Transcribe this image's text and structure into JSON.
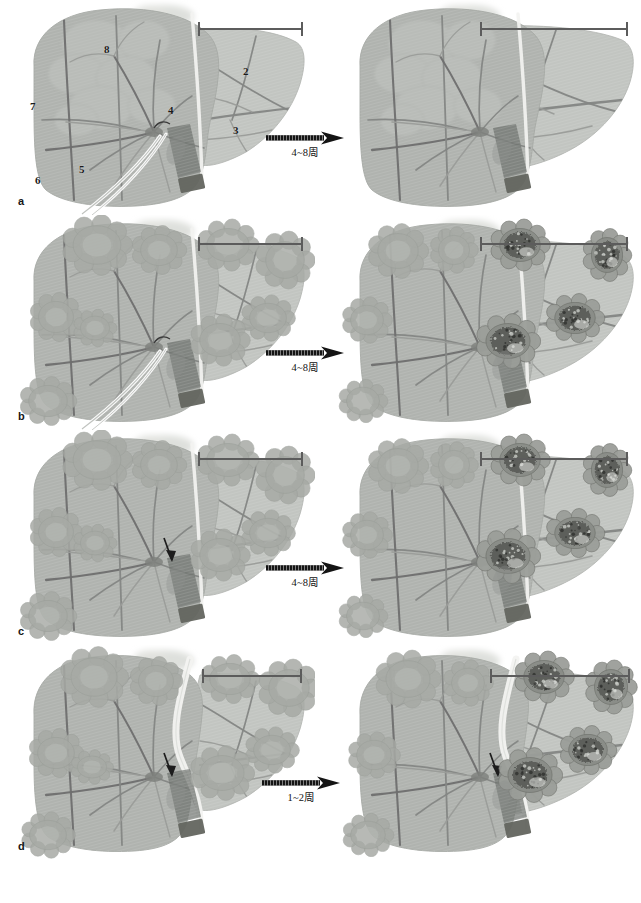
{
  "figure": {
    "width": 641,
    "height": 903,
    "background": "#ffffff"
  },
  "colors": {
    "liver_fill": "#b9bcb8",
    "liver_fill_light": "#c6c9c5",
    "liver_left_lobe": "#b0b3af",
    "liver_right_lobe": "#c2c5c1",
    "vessel_dark": "#6f6f6f",
    "vessel_mid": "#848684",
    "vessel_light": "#9a9c99",
    "gallbladder": "#8d8f8c",
    "clamp": "#6e716d",
    "tumor_light": "#a7aaa5",
    "tumor_dark": "#5a5c58",
    "bracket": "#5c5c5c",
    "arrow": "#141414",
    "text": "#161616",
    "ligament_white": "#f3f3f1"
  },
  "segments": {
    "caption": "Couinaud liver segment numbers shown on panel a (left image)",
    "labels": [
      {
        "id": "seg-8",
        "text": "8",
        "x": 104,
        "y": 44
      },
      {
        "id": "seg-2",
        "text": "2",
        "x": 243,
        "y": 66
      },
      {
        "id": "seg-4",
        "text": "4",
        "x": 168,
        "y": 105
      },
      {
        "id": "seg-3",
        "text": "3",
        "x": 233,
        "y": 125
      },
      {
        "id": "seg-7",
        "text": "7",
        "x": 30,
        "y": 101
      },
      {
        "id": "seg-5",
        "text": "5",
        "x": 79,
        "y": 164
      },
      {
        "id": "seg-6",
        "text": "6",
        "x": 35,
        "y": 175
      }
    ]
  },
  "rows": [
    {
      "id": "row-a",
      "letter": "a",
      "top": 0,
      "arrow": {
        "label": "4~8周",
        "x": 266,
        "y": 131
      },
      "left": {
        "id": "panel-a-before",
        "name": "liver-before-a",
        "description": "Normal liver with portal clamp and catheter, segment numbers labelled",
        "tumors": [],
        "tumor_style": "none",
        "has_catheter": true,
        "has_clamp": true,
        "shape": "normal",
        "bracket": {
          "x": 194,
          "y": 22,
          "width": 105
        }
      },
      "right": {
        "id": "panel-a-after",
        "name": "liver-after-a",
        "description": "Hypertrophied right lobe after 4-8 weeks",
        "tumors": [],
        "tumor_style": "none",
        "has_catheter": false,
        "has_clamp": true,
        "shape": "hypertrophy",
        "bracket": {
          "x": 150,
          "y": 22,
          "width": 148
        }
      }
    },
    {
      "id": "row-b",
      "letter": "b",
      "top": 215,
      "arrow": {
        "label": "4~8周",
        "x": 266,
        "y": 346
      },
      "left": {
        "id": "panel-b-before",
        "name": "liver-before-b",
        "description": "Liver with multiple pale metastatic nodules and indwelling catheter",
        "tumors": [
          {
            "x": 93,
            "y": 30,
            "rx": 26,
            "ry": 21,
            "tone": "light"
          },
          {
            "x": 155,
            "y": 35,
            "rx": 20,
            "ry": 17,
            "tone": "light"
          },
          {
            "x": 52,
            "y": 102,
            "rx": 19,
            "ry": 17,
            "tone": "light"
          },
          {
            "x": 91,
            "y": 113,
            "rx": 16,
            "ry": 13,
            "tone": "light"
          },
          {
            "x": 44,
            "y": 186,
            "rx": 21,
            "ry": 17,
            "tone": "light"
          },
          {
            "x": 224,
            "y": 30,
            "rx": 23,
            "ry": 18,
            "tone": "light"
          },
          {
            "x": 281,
            "y": 45,
            "rx": 21,
            "ry": 20,
            "tone": "light"
          },
          {
            "x": 264,
            "y": 103,
            "rx": 20,
            "ry": 16,
            "tone": "light"
          },
          {
            "x": 216,
            "y": 125,
            "rx": 22,
            "ry": 18,
            "tone": "light"
          }
        ],
        "tumor_style": "light",
        "has_catheter": true,
        "has_clamp": true,
        "shape": "normal",
        "bracket": {
          "x": 194,
          "y": 22,
          "width": 105
        }
      },
      "right": {
        "id": "panel-b-after",
        "name": "liver-after-b",
        "description": "After 4-8 weeks: right lobe hypertrophy with enlarged dark necrotic tumours",
        "tumors": [
          {
            "x": 68,
            "y": 36,
            "rx": 22,
            "ry": 19,
            "tone": "light"
          },
          {
            "x": 124,
            "y": 35,
            "rx": 17,
            "ry": 16,
            "tone": "light"
          },
          {
            "x": 37,
            "y": 105,
            "rx": 18,
            "ry": 16,
            "tone": "light"
          },
          {
            "x": 33,
            "y": 186,
            "rx": 18,
            "ry": 15,
            "tone": "light"
          },
          {
            "x": 190,
            "y": 30,
            "rx": 22,
            "ry": 18,
            "tone": "dark"
          },
          {
            "x": 277,
            "y": 40,
            "rx": 17,
            "ry": 19,
            "tone": "dark"
          },
          {
            "x": 245,
            "y": 103,
            "rx": 22,
            "ry": 17,
            "tone": "dark"
          },
          {
            "x": 178,
            "y": 126,
            "rx": 24,
            "ry": 19,
            "tone": "dark"
          }
        ],
        "tumor_style": "dark",
        "has_catheter": false,
        "has_clamp": true,
        "shape": "hypertrophy",
        "bracket": {
          "x": 150,
          "y": 22,
          "width": 148
        }
      }
    },
    {
      "id": "row-c",
      "letter": "c",
      "top": 430,
      "arrow": {
        "label": "4~8周",
        "x": 266,
        "y": 561
      },
      "left": {
        "id": "panel-c-before",
        "name": "liver-before-c",
        "description": "Liver with pale nodules, portal vein ligated (arrowhead), no catheter",
        "tumors": [
          {
            "x": 93,
            "y": 30,
            "rx": 26,
            "ry": 21,
            "tone": "light"
          },
          {
            "x": 155,
            "y": 35,
            "rx": 20,
            "ry": 17,
            "tone": "light"
          },
          {
            "x": 52,
            "y": 102,
            "rx": 19,
            "ry": 17,
            "tone": "light"
          },
          {
            "x": 91,
            "y": 113,
            "rx": 16,
            "ry": 13,
            "tone": "light"
          },
          {
            "x": 44,
            "y": 186,
            "rx": 21,
            "ry": 17,
            "tone": "light"
          },
          {
            "x": 224,
            "y": 30,
            "rx": 23,
            "ry": 18,
            "tone": "light"
          },
          {
            "x": 281,
            "y": 45,
            "rx": 21,
            "ry": 20,
            "tone": "light"
          },
          {
            "x": 264,
            "y": 103,
            "rx": 20,
            "ry": 16,
            "tone": "light"
          },
          {
            "x": 216,
            "y": 125,
            "rx": 22,
            "ry": 18,
            "tone": "light"
          }
        ],
        "tumor_style": "light",
        "has_catheter": false,
        "has_clamp": true,
        "has_ligation_arrow": true,
        "shape": "normal",
        "bracket": {
          "x": 194,
          "y": 22,
          "width": 105
        }
      },
      "right": {
        "id": "panel-c-after",
        "name": "liver-after-c",
        "description": "After 4-8 weeks: hypertrophy with dark tumours in right lobe",
        "tumors": [
          {
            "x": 68,
            "y": 36,
            "rx": 22,
            "ry": 19,
            "tone": "light"
          },
          {
            "x": 124,
            "y": 35,
            "rx": 17,
            "ry": 16,
            "tone": "light"
          },
          {
            "x": 37,
            "y": 105,
            "rx": 18,
            "ry": 16,
            "tone": "light"
          },
          {
            "x": 33,
            "y": 186,
            "rx": 18,
            "ry": 15,
            "tone": "light"
          },
          {
            "x": 190,
            "y": 30,
            "rx": 22,
            "ry": 18,
            "tone": "dark"
          },
          {
            "x": 277,
            "y": 40,
            "rx": 17,
            "ry": 19,
            "tone": "dark"
          },
          {
            "x": 245,
            "y": 103,
            "rx": 22,
            "ry": 17,
            "tone": "dark"
          },
          {
            "x": 178,
            "y": 126,
            "rx": 24,
            "ry": 19,
            "tone": "dark"
          }
        ],
        "tumor_style": "dark",
        "has_catheter": false,
        "has_clamp": true,
        "has_ligation_arrow": true,
        "shape": "hypertrophy",
        "bracket": {
          "x": 150,
          "y": 22,
          "width": 148
        }
      }
    },
    {
      "id": "row-d",
      "letter": "d",
      "top": 645,
      "arrow": {
        "label": "1~2周",
        "x": 262,
        "y": 776
      },
      "left": {
        "id": "panel-d-before",
        "name": "liver-before-d",
        "description": "In-situ split (ALPPS) liver with parenchymal transection line and pale nodules",
        "tumors": [
          {
            "x": 90,
            "y": 32,
            "rx": 25,
            "ry": 21,
            "tone": "light"
          },
          {
            "x": 152,
            "y": 36,
            "rx": 19,
            "ry": 17,
            "tone": "light"
          },
          {
            "x": 52,
            "y": 108,
            "rx": 20,
            "ry": 17,
            "tone": "light"
          },
          {
            "x": 88,
            "y": 122,
            "rx": 16,
            "ry": 12,
            "tone": "light"
          },
          {
            "x": 44,
            "y": 190,
            "rx": 20,
            "ry": 16,
            "tone": "light"
          },
          {
            "x": 226,
            "y": 34,
            "rx": 22,
            "ry": 17,
            "tone": "light"
          },
          {
            "x": 285,
            "y": 43,
            "rx": 22,
            "ry": 20,
            "tone": "light"
          },
          {
            "x": 268,
            "y": 105,
            "rx": 20,
            "ry": 16,
            "tone": "light"
          },
          {
            "x": 218,
            "y": 128,
            "rx": 24,
            "ry": 19,
            "tone": "light"
          }
        ],
        "tumor_style": "light",
        "has_catheter": false,
        "has_clamp": true,
        "has_ligation_arrow": true,
        "shape": "split",
        "bracket": {
          "x": 198,
          "y": 24,
          "width": 100
        }
      },
      "right": {
        "id": "panel-d-after",
        "name": "liver-after-d",
        "description": "After 1-2 weeks: rapid hypertrophy of the split liver with dark tumours",
        "tumors": [
          {
            "x": 78,
            "y": 34,
            "rx": 24,
            "ry": 20,
            "tone": "light"
          },
          {
            "x": 138,
            "y": 38,
            "rx": 18,
            "ry": 16,
            "tone": "light"
          },
          {
            "x": 44,
            "y": 110,
            "rx": 19,
            "ry": 16,
            "tone": "light"
          },
          {
            "x": 38,
            "y": 190,
            "rx": 19,
            "ry": 15,
            "tone": "light"
          },
          {
            "x": 214,
            "y": 32,
            "rx": 22,
            "ry": 18,
            "tone": "dark"
          },
          {
            "x": 281,
            "y": 42,
            "rx": 18,
            "ry": 19,
            "tone": "dark"
          },
          {
            "x": 258,
            "y": 105,
            "rx": 21,
            "ry": 17,
            "tone": "dark"
          },
          {
            "x": 200,
            "y": 130,
            "rx": 24,
            "ry": 19,
            "tone": "dark"
          }
        ],
        "tumor_style": "dark",
        "has_catheter": false,
        "has_clamp": true,
        "has_ligation_arrow": true,
        "shape": "split-hypertrophy",
        "bracket": {
          "x": 160,
          "y": 24,
          "width": 140
        }
      }
    }
  ]
}
